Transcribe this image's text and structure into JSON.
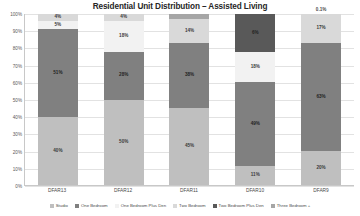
{
  "chart_data": {
    "type": "bar",
    "title": "Residential Unit Distribution – Assisted Living",
    "xlabel": "",
    "ylabel": "",
    "ylim": [
      0,
      100
    ],
    "grid": true,
    "stacked": true,
    "stack_percent": true,
    "legend_position": "bottom",
    "categories": [
      "DFAR13",
      "DFAR12",
      "DFAR11",
      "DFAR10",
      "DFAR9"
    ],
    "ytick_labels": [
      "0%",
      "10%",
      "20%",
      "30%",
      "40%",
      "50%",
      "60%",
      "70%",
      "80%",
      "90%",
      "100%"
    ],
    "ytick_values": [
      0,
      10,
      20,
      30,
      40,
      50,
      60,
      70,
      80,
      90,
      100
    ],
    "series": [
      {
        "name": "Studio",
        "color": "#bfbfbf",
        "values": [
          40,
          50,
          45,
          11,
          20
        ],
        "labels": [
          "40%",
          "50%",
          "45%",
          "11%",
          "20%"
        ]
      },
      {
        "name": "One Bedroom",
        "color": "#808080",
        "values": [
          51,
          28,
          38,
          49,
          63
        ],
        "labels": [
          "51%",
          "28%",
          "38%",
          "49%",
          "63%"
        ]
      },
      {
        "name": "One Bedroom Plus Den",
        "color": "#f2f2f2",
        "values": [
          5,
          18,
          0,
          18,
          0
        ],
        "labels": [
          "5%",
          "18%",
          "",
          "18%",
          ""
        ]
      },
      {
        "name": "Two Bedroom",
        "color": "#d9d9d9",
        "values": [
          4,
          4,
          14,
          0,
          17
        ],
        "labels": [
          "4%",
          "4%",
          "14%",
          "",
          "17%"
        ]
      },
      {
        "name": "Two Bedroom Plus Den",
        "color": "#595959",
        "values": [
          0,
          0,
          0,
          22,
          0
        ],
        "labels": [
          "",
          "",
          "",
          "6%",
          ""
        ]
      },
      {
        "name": "Three Bedroom +",
        "color": "#a6a6a6",
        "values": [
          0,
          0,
          3,
          0,
          0.1
        ],
        "labels": [
          "",
          "",
          "",
          "",
          "0.1%"
        ]
      }
    ],
    "outside_labels": [
      {
        "category": "DFAR9",
        "text": "0.1%"
      }
    ]
  },
  "legend": {
    "items": [
      {
        "label": "Studio"
      },
      {
        "label": "One Bedroom"
      },
      {
        "label": "One Bedroom Plus Den"
      },
      {
        "label": "Two Bedroom"
      },
      {
        "label": "Two Bedroom Plus Den"
      },
      {
        "label": "Three Bedroom +"
      }
    ]
  }
}
